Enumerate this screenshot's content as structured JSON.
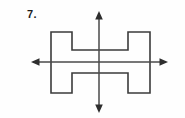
{
  "page": {
    "background_color": "#fefefe",
    "width": 185,
    "height": 118
  },
  "problem": {
    "number_label": "7.",
    "label_color": "#1b1b1b"
  },
  "figure": {
    "shape_name": "h-shape-polygon",
    "stroke_color": "#3b3b3b",
    "fill_color": "none",
    "stroke_width": 1.6,
    "vertices": [
      [
        51,
        32
      ],
      [
        72,
        32
      ],
      [
        72,
        50
      ],
      [
        128,
        50
      ],
      [
        128,
        32
      ],
      [
        150,
        32
      ],
      [
        150,
        93
      ],
      [
        128,
        93
      ],
      [
        128,
        73
      ],
      [
        72,
        73
      ],
      [
        72,
        93
      ],
      [
        51,
        93
      ]
    ],
    "bounds": {
      "left": 51,
      "top": 32,
      "right": 150,
      "bottom": 93
    }
  },
  "axes": {
    "color": "#4a4a4a",
    "arrow_color": "#2e2e2e",
    "origin": {
      "x": 99,
      "y": 62
    },
    "horizontal": {
      "name": "x-axis",
      "from_x": 31,
      "to_x": 168,
      "y": 62,
      "arrow_left": true,
      "arrow_right": true
    },
    "vertical": {
      "name": "y-axis",
      "x": 99,
      "from_y": 11,
      "to_y": 113,
      "arrow_up": true,
      "arrow_down": true
    }
  }
}
